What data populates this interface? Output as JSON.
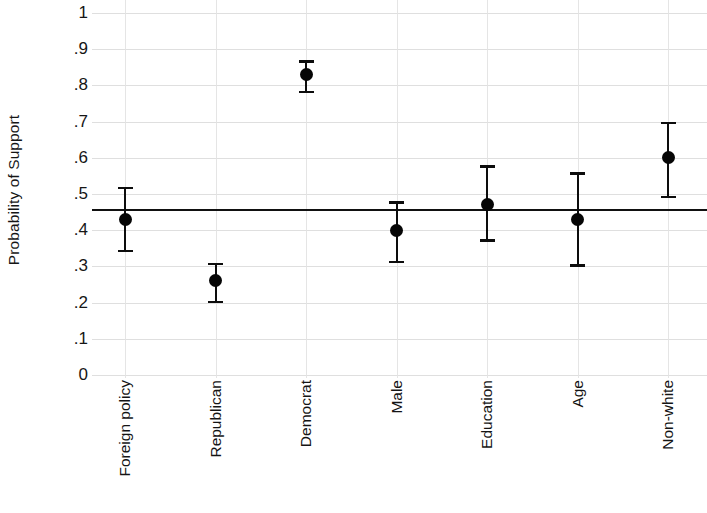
{
  "chart_data": {
    "type": "scatter",
    "title": "",
    "subtitle": "",
    "xlabel": "",
    "ylabel": "Probability of Support",
    "ylim": [
      0,
      1
    ],
    "ytick_labels": [
      "0",
      ".1",
      ".2",
      ".3",
      ".4",
      ".5",
      ".6",
      ".7",
      ".8",
      ".9",
      "1"
    ],
    "ytick_values": [
      0,
      0.1,
      0.2,
      0.3,
      0.4,
      0.5,
      0.6,
      0.7,
      0.8,
      0.9,
      1
    ],
    "grid": true,
    "legend": "none",
    "categories": [
      "Foreign policy",
      "Republican",
      "Democrat",
      "Male",
      "Education",
      "Age",
      "Non-white"
    ],
    "values": [
      0.43,
      0.26,
      0.83,
      0.4,
      0.47,
      0.43,
      0.6
    ],
    "ci_lower": [
      0.34,
      0.2,
      0.78,
      0.31,
      0.37,
      0.3,
      0.49
    ],
    "ci_upper": [
      0.52,
      0.31,
      0.87,
      0.48,
      0.58,
      0.56,
      0.7
    ],
    "reference_line": {
      "value": 0.455,
      "label": "baseline probability",
      "color": "#111111"
    },
    "marker": "filled-circle",
    "marker_color": "#060606",
    "error_bar_color": "#0d0d0d",
    "grid_color": "#d9d9d9",
    "background_color": "#ffffff",
    "points": [
      {
        "category": "Foreign policy",
        "value": 0.43,
        "ci_lower": 0.34,
        "ci_upper": 0.52
      },
      {
        "category": "Republican",
        "value": 0.26,
        "ci_lower": 0.2,
        "ci_upper": 0.31
      },
      {
        "category": "Democrat",
        "value": 0.83,
        "ci_lower": 0.78,
        "ci_upper": 0.87
      },
      {
        "category": "Male",
        "value": 0.4,
        "ci_lower": 0.31,
        "ci_upper": 0.48
      },
      {
        "category": "Education",
        "value": 0.47,
        "ci_lower": 0.37,
        "ci_upper": 0.58
      },
      {
        "category": "Age",
        "value": 0.43,
        "ci_lower": 0.3,
        "ci_upper": 0.56
      },
      {
        "category": "Non-white",
        "value": 0.6,
        "ci_lower": 0.49,
        "ci_upper": 0.7
      }
    ]
  },
  "axis": {
    "y_title": "Probability of Support",
    "y_ticks": [
      "1",
      ".9",
      ".8",
      ".7",
      ".6",
      ".5",
      ".4",
      ".3",
      ".2",
      ".1",
      "0"
    ],
    "x_ticks": [
      "Foreign policy",
      "Republican",
      "Democrat",
      "Male",
      "Education",
      "Age",
      "Non-white"
    ]
  }
}
